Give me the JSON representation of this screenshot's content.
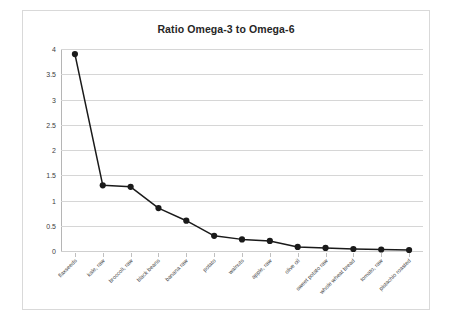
{
  "chart_data": {
    "type": "line",
    "title": "Ratio Omega-3 to Omega-6",
    "xlabel": "",
    "ylabel": "",
    "ylim": [
      0,
      4
    ],
    "ytick_step": 0.5,
    "yticks": [
      "0",
      "0.5",
      "1",
      "1.5",
      "2",
      "2.5",
      "3",
      "3.5",
      "4"
    ],
    "grid": true,
    "legend": "none",
    "marker": "filled-circle",
    "line_color": "#1a1a1a",
    "marker_color": "#1a1a1a",
    "categories": [
      "flaxseeds",
      "kale, raw",
      "broccoli, raw",
      "black beans",
      "banana raw",
      "potato",
      "walnuts",
      "apple, raw",
      "olive oil",
      "sweet potato raw",
      "whole wheat bread",
      "tomato, raw",
      "pistachio roasted"
    ],
    "values": [
      3.9,
      1.3,
      1.27,
      0.85,
      0.6,
      0.3,
      0.23,
      0.2,
      0.08,
      0.06,
      0.04,
      0.03,
      0.02
    ]
  },
  "page": {
    "background": "#ffffff",
    "frame_border_color": "#d9d9d9"
  }
}
